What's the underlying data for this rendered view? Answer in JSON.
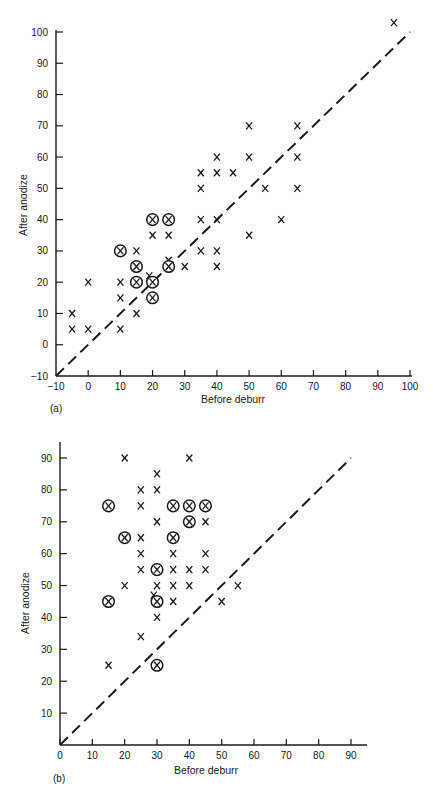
{
  "chart_data": [
    {
      "panel": "(a)",
      "type": "scatter",
      "title": "",
      "xlabel": "Before deburr",
      "ylabel": "After anodize",
      "xlim": [
        -10,
        100
      ],
      "ylim": [
        -10,
        100
      ],
      "xticks": [
        -10,
        0,
        10,
        20,
        30,
        40,
        50,
        60,
        70,
        80,
        90,
        100
      ],
      "yticks": [
        -10,
        0,
        10,
        20,
        30,
        40,
        50,
        60,
        70,
        80,
        90,
        100
      ],
      "grid": false,
      "reference_line": {
        "style": "dashed",
        "from": [
          -10,
          -10
        ],
        "to": [
          100,
          100
        ],
        "label": "y = x"
      },
      "series": [
        {
          "name": "X",
          "marker": "x",
          "points": [
            [
              -5,
              10
            ],
            [
              -5,
              5
            ],
            [
              0,
              20
            ],
            [
              0,
              5
            ],
            [
              10,
              20
            ],
            [
              10,
              15
            ],
            [
              10,
              5
            ],
            [
              15,
              30
            ],
            [
              15,
              10
            ],
            [
              19,
              22
            ],
            [
              20,
              35
            ],
            [
              25,
              35
            ],
            [
              25,
              27
            ],
            [
              30,
              25
            ],
            [
              35,
              55
            ],
            [
              35,
              50
            ],
            [
              35,
              40
            ],
            [
              35,
              30
            ],
            [
              40,
              60
            ],
            [
              40,
              55
            ],
            [
              40,
              40
            ],
            [
              40,
              30
            ],
            [
              40,
              25
            ],
            [
              45,
              55
            ],
            [
              50,
              70
            ],
            [
              50,
              60
            ],
            [
              50,
              35
            ],
            [
              55,
              50
            ],
            [
              60,
              40
            ],
            [
              65,
              70
            ],
            [
              65,
              60
            ],
            [
              65,
              50
            ],
            [
              95,
              103
            ]
          ]
        },
        {
          "name": "Circled X",
          "marker": "circled-x",
          "points": [
            [
              10,
              30
            ],
            [
              15,
              25
            ],
            [
              15,
              20
            ],
            [
              20,
              40
            ],
            [
              25,
              40
            ],
            [
              20,
              20
            ],
            [
              20,
              15
            ],
            [
              25,
              25
            ]
          ]
        }
      ]
    },
    {
      "panel": "(b)",
      "type": "scatter",
      "title": "",
      "xlabel": "Before deburr",
      "ylabel": "After anodize",
      "xlim": [
        0,
        95
      ],
      "ylim": [
        0,
        95
      ],
      "xticks": [
        0,
        10,
        20,
        30,
        40,
        50,
        60,
        70,
        80,
        90
      ],
      "yticks": [
        10,
        20,
        30,
        40,
        50,
        60,
        70,
        80,
        90
      ],
      "grid": false,
      "reference_line": {
        "style": "dashed",
        "from": [
          0,
          0
        ],
        "to": [
          90,
          90
        ],
        "label": "y = x"
      },
      "series": [
        {
          "name": "X",
          "marker": "x",
          "points": [
            [
              20,
              90
            ],
            [
              40,
              90
            ],
            [
              30,
              85
            ],
            [
              25,
              80
            ],
            [
              30,
              80
            ],
            [
              25,
              75
            ],
            [
              30,
              70
            ],
            [
              45,
              70
            ],
            [
              25,
              65
            ],
            [
              25,
              60
            ],
            [
              35,
              60
            ],
            [
              45,
              60
            ],
            [
              25,
              55
            ],
            [
              35,
              55
            ],
            [
              40,
              55
            ],
            [
              45,
              55
            ],
            [
              20,
              50
            ],
            [
              30,
              50
            ],
            [
              35,
              50
            ],
            [
              40,
              50
            ],
            [
              55,
              50
            ],
            [
              29,
              47
            ],
            [
              35,
              45
            ],
            [
              50,
              45
            ],
            [
              30,
              40
            ],
            [
              25,
              34
            ],
            [
              15,
              25
            ]
          ]
        },
        {
          "name": "Circled X",
          "marker": "circled-x",
          "points": [
            [
              15,
              75
            ],
            [
              35,
              75
            ],
            [
              40,
              75
            ],
            [
              45,
              75
            ],
            [
              40,
              70
            ],
            [
              20,
              65
            ],
            [
              35,
              65
            ],
            [
              30,
              55
            ],
            [
              15,
              45
            ],
            [
              30,
              45
            ],
            [
              30,
              25
            ]
          ]
        }
      ]
    }
  ],
  "panels": {
    "a": {
      "label": "(a)",
      "xlabel": "Before deburr",
      "ylabel": "After anodize"
    },
    "b": {
      "label": "(b)",
      "xlabel": "Before deburr",
      "ylabel": "After anodize"
    }
  },
  "marker_glyph": "X"
}
